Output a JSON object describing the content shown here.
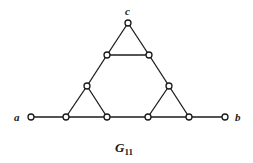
{
  "diagram": {
    "caption": {
      "main": "G",
      "subscript": "11"
    },
    "labels": {
      "a": "a",
      "b": "b",
      "c": "c"
    },
    "nodes": [
      {
        "id": "a",
        "x": 31,
        "y": 117
      },
      {
        "id": "n1",
        "x": 66,
        "y": 117
      },
      {
        "id": "n2",
        "x": 107,
        "y": 117
      },
      {
        "id": "n3",
        "x": 148,
        "y": 117
      },
      {
        "id": "n4",
        "x": 189,
        "y": 117
      },
      {
        "id": "b",
        "x": 225,
        "y": 117
      },
      {
        "id": "ll",
        "x": 87,
        "y": 86
      },
      {
        "id": "lr",
        "x": 169,
        "y": 86
      },
      {
        "id": "ml",
        "x": 107,
        "y": 55
      },
      {
        "id": "mr",
        "x": 149,
        "y": 55
      },
      {
        "id": "c",
        "x": 128,
        "y": 23
      }
    ],
    "edges": [
      [
        "a",
        "n1"
      ],
      [
        "n1",
        "n2"
      ],
      [
        "n2",
        "n3"
      ],
      [
        "n3",
        "n4"
      ],
      [
        "n4",
        "b"
      ],
      [
        "n1",
        "ll"
      ],
      [
        "ll",
        "n2"
      ],
      [
        "n3",
        "lr"
      ],
      [
        "lr",
        "n4"
      ],
      [
        "ll",
        "ml"
      ],
      [
        "lr",
        "mr"
      ],
      [
        "ml",
        "mr"
      ],
      [
        "ml",
        "c"
      ],
      [
        "mr",
        "c"
      ]
    ]
  }
}
